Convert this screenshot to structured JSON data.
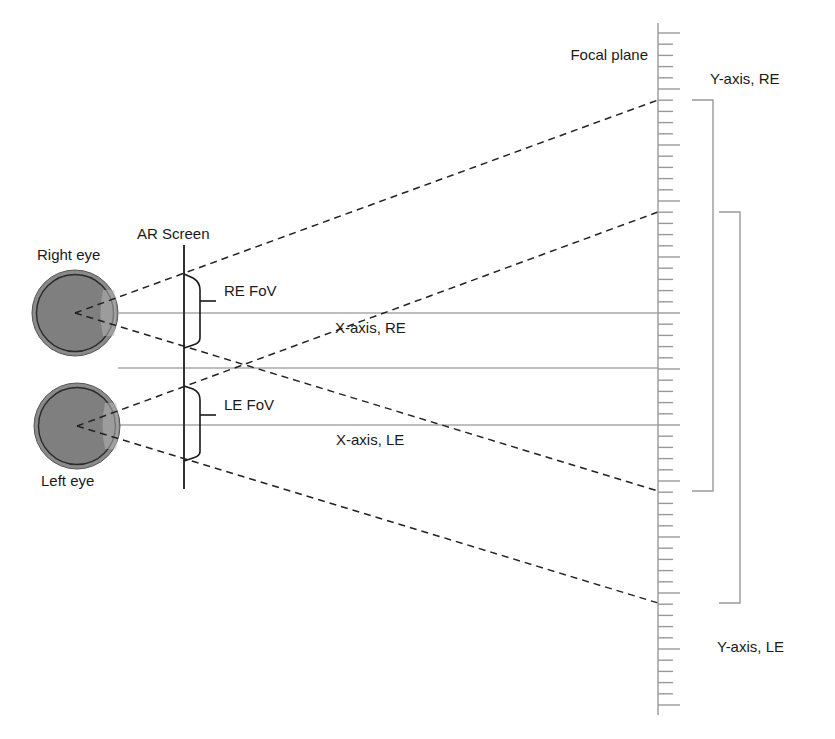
{
  "labels": {
    "right_eye": "Right eye",
    "left_eye": "Left eye",
    "ar_screen": "AR Screen",
    "re_fov": "RE FoV",
    "le_fov": "LE FoV",
    "x_axis_re": "X-axis, RE",
    "x_axis_le": "X-axis, LE",
    "focal_plane": "Focal plane",
    "y_axis_re": "Y-axis, RE",
    "y_axis_le": "Y-axis, LE"
  },
  "geometry": {
    "right_eye": {
      "cx": 75,
      "cy": 313,
      "r": 43
    },
    "left_eye": {
      "cx": 77,
      "cy": 426,
      "r": 43
    },
    "ar_screen_x": 184,
    "ar_screen_y": [
      245,
      489
    ],
    "focal_plane_x": 658,
    "focal_plane_y": [
      23,
      715
    ],
    "tick_spacing": 11.2,
    "horizontal_axes_y": [
      313,
      368,
      425
    ],
    "re_fov_ray_ends_y": [
      100,
      491
    ],
    "le_fov_ray_ends_y": [
      212,
      603
    ]
  },
  "colors": {
    "eye_fill": "#7f7f7f",
    "eye_ring": "#2a2a2a",
    "ray": "#222222",
    "axis": "#a8a8a8",
    "ruler": "#999999",
    "screen": "#333333"
  }
}
